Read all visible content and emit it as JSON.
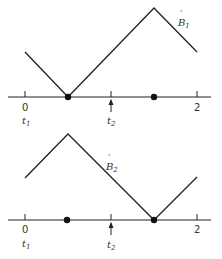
{
  "colors": {
    "line": "#222222",
    "text": "#333333",
    "background": "#ffffff"
  },
  "top_plot": {
    "curve_label": "B",
    "curve_label_sub": "1",
    "curve_label_accent": "°",
    "axis_labels": {
      "start": "0",
      "end": "2"
    },
    "time_labels": {
      "t1": "t",
      "t1_sub": "1",
      "t2": "t",
      "t2_sub": "2"
    }
  },
  "bottom_plot": {
    "curve_label": "B",
    "curve_label_sub": "2",
    "curve_label_accent": "°",
    "axis_labels": {
      "start": "0",
      "end": "2"
    },
    "time_labels": {
      "t1": "t",
      "t1_sub": "1",
      "t2": "t",
      "t2_sub": "2"
    }
  }
}
